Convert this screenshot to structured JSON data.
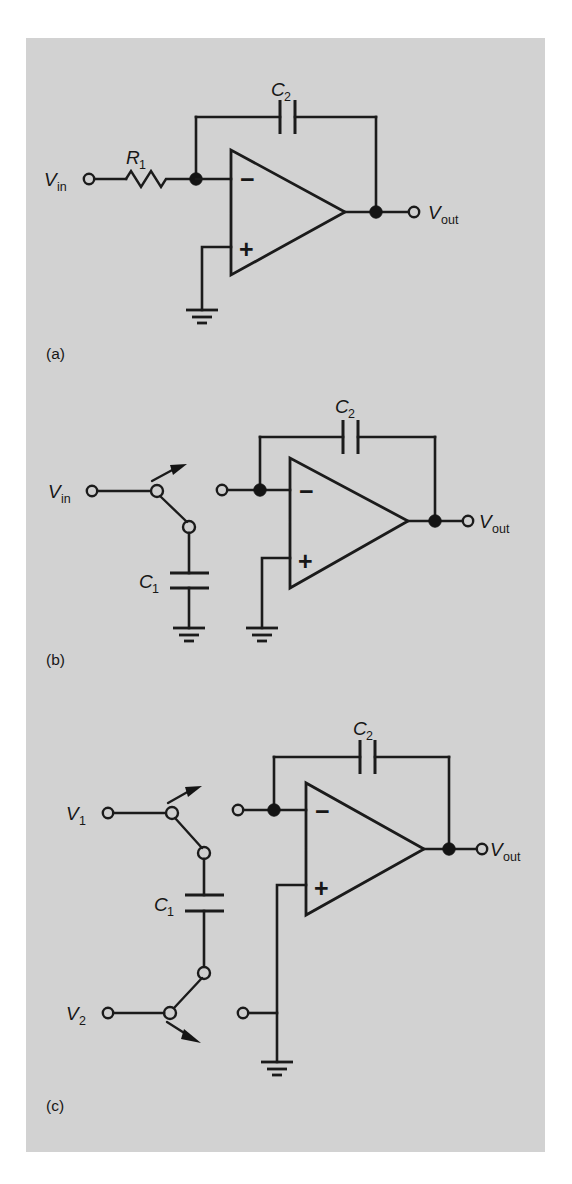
{
  "figure": {
    "background_color": "#ffffff",
    "panel_color": "#d2d2d2",
    "ink_color": "#1b1b1b",
    "panels": [
      {
        "id": "a",
        "caption": "(a)",
        "title_description": "Continuous-time inverting integrator with input resistor",
        "components": [
          {
            "ref": "R_1",
            "type": "resistor",
            "label_main": "R",
            "label_sub": "1"
          },
          {
            "ref": "C_2",
            "type": "capacitor",
            "label_main": "C",
            "label_sub": "2"
          },
          {
            "ref": "A1",
            "type": "op-amp",
            "inverting_sign": "−",
            "noninverting_sign": "+"
          }
        ],
        "terminals": [
          {
            "ref": "Vin",
            "label_main": "V",
            "label_sub": "in",
            "side": "left"
          },
          {
            "ref": "Vout",
            "label_main": "V",
            "label_sub": "out",
            "side": "right"
          }
        ],
        "grounds": 1
      },
      {
        "id": "b",
        "caption": "(b)",
        "title_description": "Switched-capacitor integrator, single-ended input",
        "components": [
          {
            "ref": "C_1",
            "type": "capacitor",
            "label_main": "C",
            "label_sub": "1"
          },
          {
            "ref": "C_2",
            "type": "capacitor",
            "label_main": "C",
            "label_sub": "2"
          },
          {
            "ref": "A1",
            "type": "op-amp",
            "inverting_sign": "−",
            "noninverting_sign": "+"
          },
          {
            "ref": "S1",
            "type": "spdt-switch"
          }
        ],
        "terminals": [
          {
            "ref": "Vin",
            "label_main": "V",
            "label_sub": "in",
            "side": "left"
          },
          {
            "ref": "Vout",
            "label_main": "V",
            "label_sub": "out",
            "side": "right"
          }
        ],
        "grounds": 2
      },
      {
        "id": "c",
        "caption": "(c)",
        "title_description": "Differential switched-capacitor integrator with two input switches",
        "components": [
          {
            "ref": "C_1",
            "type": "capacitor",
            "label_main": "C",
            "label_sub": "1"
          },
          {
            "ref": "C_2",
            "type": "capacitor",
            "label_main": "C",
            "label_sub": "2"
          },
          {
            "ref": "A1",
            "type": "op-amp",
            "inverting_sign": "−",
            "noninverting_sign": "+"
          },
          {
            "ref": "S1",
            "type": "spdt-switch"
          },
          {
            "ref": "S2",
            "type": "spdt-switch"
          }
        ],
        "terminals": [
          {
            "ref": "V1",
            "label_main": "V",
            "label_sub": "1",
            "side": "left"
          },
          {
            "ref": "V2",
            "label_main": "V",
            "label_sub": "2",
            "side": "left"
          },
          {
            "ref": "Vout",
            "label_main": "V",
            "label_sub": "out",
            "side": "right"
          }
        ],
        "grounds": 1
      }
    ],
    "labels": {
      "vin": {
        "main": "V",
        "sub": "in"
      },
      "vout": {
        "main": "V",
        "sub": "out"
      },
      "v1": {
        "main": "V",
        "sub": "1"
      },
      "v2": {
        "main": "V",
        "sub": "2"
      },
      "r1": {
        "main": "R",
        "sub": "1"
      },
      "c1": {
        "main": "C",
        "sub": "1"
      },
      "c2": {
        "main": "C",
        "sub": "2"
      },
      "minus": "−",
      "plus": "+",
      "caption_a": "(a)",
      "caption_b": "(b)",
      "caption_c": "(c)"
    }
  }
}
